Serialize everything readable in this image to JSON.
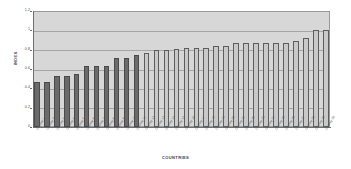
{
  "chart_data": {
    "type": "bar",
    "title": "",
    "xlabel": "COUNTRIES",
    "ylabel": "INDEX",
    "ylim": [
      0,
      1.2
    ],
    "ytick_labels": [
      "1.2",
      "1",
      "0.8",
      "0.6",
      "0.4",
      "0.2",
      "0"
    ],
    "ytick_values": [
      1.2,
      1.0,
      0.8,
      0.6,
      0.4,
      0.2,
      0
    ],
    "grid": true,
    "legend": "none",
    "plot_background": "#d7d7d7",
    "series_colors": {
      "low_group": "#6b6b6b",
      "high_group": "#c9c9c9"
    },
    "categories": [
      "Country 1",
      "Country 2",
      "Country 3",
      "Country 4",
      "Country 5",
      "Country 6",
      "Country 7",
      "Country 8",
      "Country 9",
      "Country 10",
      "Country 11",
      "Country 12",
      "Country 13",
      "Country 14",
      "Country 15",
      "Country 16",
      "Country 17",
      "Country 18",
      "Country 19",
      "Country 20",
      "Country 21",
      "Country 22",
      "Country 23",
      "Country 24",
      "Country 25",
      "Country 26",
      "Country 27",
      "Country 28",
      "Country 29",
      "Country 30"
    ],
    "values": [
      0.47,
      0.47,
      0.53,
      0.53,
      0.55,
      0.63,
      0.63,
      0.63,
      0.71,
      0.71,
      0.74,
      0.77,
      0.8,
      0.8,
      0.81,
      0.82,
      0.82,
      0.82,
      0.84,
      0.84,
      0.87,
      0.87,
      0.87,
      0.87,
      0.87,
      0.87,
      0.89,
      0.92,
      1.0,
      1.0
    ],
    "bar_groups": [
      "dark",
      "dark",
      "dark",
      "dark",
      "dark",
      "dark",
      "dark",
      "dark",
      "dark",
      "dark",
      "dark",
      "light",
      "light",
      "light",
      "light",
      "light",
      "light",
      "light",
      "light",
      "light",
      "light",
      "light",
      "light",
      "light",
      "light",
      "light",
      "light",
      "light",
      "light",
      "light"
    ]
  }
}
